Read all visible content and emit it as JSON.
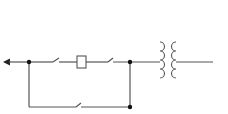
{
  "diagram": {
    "type": "electrical-schematic",
    "colors": {
      "wire": "#555555",
      "junction": "#111111",
      "background": "#ffffff"
    },
    "components": [
      {
        "id": "output-arrow",
        "kind": "arrow",
        "direction": "left"
      },
      {
        "id": "junction-left",
        "kind": "junction"
      },
      {
        "id": "switch-top-1",
        "kind": "normally-open-contact"
      },
      {
        "id": "coil-box",
        "kind": "relay-coil"
      },
      {
        "id": "switch-top-2",
        "kind": "normally-open-contact"
      },
      {
        "id": "junction-right-top",
        "kind": "junction"
      },
      {
        "id": "transformer",
        "kind": "transformer"
      },
      {
        "id": "switch-bottom",
        "kind": "normally-open-contact"
      },
      {
        "id": "junction-right-bottom",
        "kind": "junction"
      }
    ]
  }
}
